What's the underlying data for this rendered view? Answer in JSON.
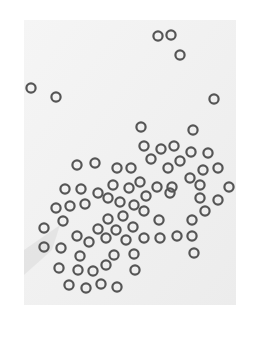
{
  "image": {
    "description": "Grayscale micrograph of small dark rings (bubbles/cells) scattered on a light background",
    "background": "#ffffff",
    "panel": {
      "x": 24,
      "y": 20,
      "w": 212,
      "h": 285,
      "color": "#f3f3f3"
    },
    "ring": {
      "radius": 4.6,
      "stroke_width": 2.2,
      "color": "#555555"
    },
    "rings": [
      [
        158,
        36
      ],
      [
        171,
        35
      ],
      [
        180,
        55
      ],
      [
        31,
        88
      ],
      [
        56,
        97
      ],
      [
        214,
        99
      ],
      [
        141,
        127
      ],
      [
        193,
        130
      ],
      [
        144,
        146
      ],
      [
        161,
        149
      ],
      [
        174,
        146
      ],
      [
        191,
        152
      ],
      [
        208,
        153
      ],
      [
        151,
        159
      ],
      [
        180,
        161
      ],
      [
        168,
        168
      ],
      [
        203,
        170
      ],
      [
        218,
        168
      ],
      [
        77,
        165
      ],
      [
        95,
        163
      ],
      [
        117,
        168
      ],
      [
        131,
        168
      ],
      [
        190,
        178
      ],
      [
        200,
        185
      ],
      [
        65,
        189
      ],
      [
        81,
        189
      ],
      [
        98,
        193
      ],
      [
        113,
        185
      ],
      [
        129,
        188
      ],
      [
        140,
        182
      ],
      [
        157,
        187
      ],
      [
        172,
        187
      ],
      [
        229,
        187
      ],
      [
        56,
        208
      ],
      [
        70,
        206
      ],
      [
        85,
        204
      ],
      [
        108,
        198
      ],
      [
        120,
        202
      ],
      [
        134,
        205
      ],
      [
        146,
        196
      ],
      [
        170,
        193
      ],
      [
        200,
        198
      ],
      [
        218,
        200
      ],
      [
        63,
        221
      ],
      [
        108,
        219
      ],
      [
        123,
        216
      ],
      [
        144,
        211
      ],
      [
        205,
        211
      ],
      [
        159,
        220
      ],
      [
        192,
        220
      ],
      [
        44,
        228
      ],
      [
        98,
        229
      ],
      [
        116,
        230
      ],
      [
        133,
        227
      ],
      [
        44,
        247
      ],
      [
        61,
        248
      ],
      [
        77,
        236
      ],
      [
        89,
        242
      ],
      [
        106,
        238
      ],
      [
        126,
        240
      ],
      [
        144,
        238
      ],
      [
        160,
        238
      ],
      [
        177,
        236
      ],
      [
        192,
        236
      ],
      [
        194,
        253
      ],
      [
        80,
        256
      ],
      [
        114,
        255
      ],
      [
        134,
        254
      ],
      [
        59,
        268
      ],
      [
        78,
        270
      ],
      [
        93,
        271
      ],
      [
        106,
        265
      ],
      [
        135,
        270
      ],
      [
        69,
        285
      ],
      [
        86,
        288
      ],
      [
        101,
        284
      ],
      [
        117,
        287
      ]
    ]
  }
}
